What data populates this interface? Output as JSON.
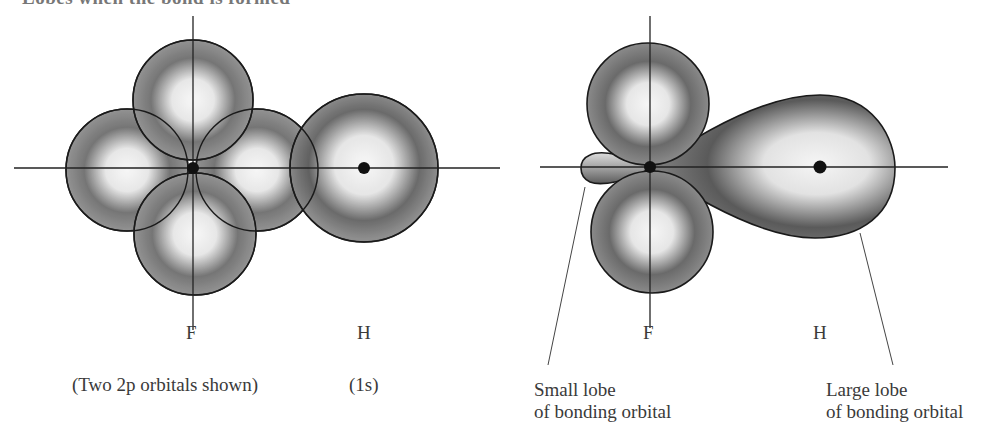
{
  "figure": {
    "caption_fragment": "Lobes when the bond is formed",
    "left_panel": {
      "atom_labels": {
        "fluorine": "F",
        "hydrogen": "H"
      },
      "captions": {
        "fluorine_orbitals": "(Two 2p orbitals shown)",
        "hydrogen_orbital": "(1s)"
      }
    },
    "right_panel": {
      "atom_labels": {
        "fluorine": "F",
        "hydrogen": "H"
      },
      "annotations": {
        "small_lobe": [
          "Small lobe",
          "of bonding orbital"
        ],
        "large_lobe": [
          "Large lobe",
          "of bonding orbital"
        ]
      }
    },
    "colors": {
      "ink": "#1a1a1a",
      "shade_dark": "#3c3c3c",
      "shade_light": "#f2f2f2",
      "text": "#3a3a3a"
    }
  }
}
